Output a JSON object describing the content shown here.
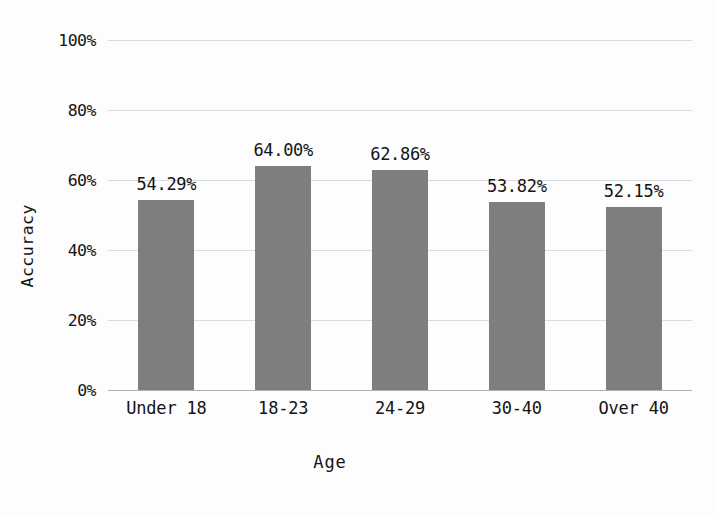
{
  "chart_data": {
    "type": "bar",
    "title": "",
    "xlabel": "Age",
    "ylabel": "Accuracy",
    "categories": [
      "Under 18",
      "18-23",
      "24-29",
      "30-40",
      "Over 40"
    ],
    "values": [
      54.29,
      64.0,
      62.86,
      53.82,
      52.15
    ],
    "value_labels": [
      "54.29%",
      "64.00%",
      "62.86%",
      "53.82%",
      "52.15%"
    ],
    "ylim": [
      0,
      100
    ],
    "yticks": [
      0,
      20,
      40,
      60,
      80,
      100
    ],
    "ytick_labels": [
      "0%",
      "20%",
      "40%",
      "60%",
      "80%",
      "100%"
    ],
    "grid": true,
    "grid_axis": "y",
    "legend": false,
    "legend_position": "none",
    "bar_color": "#7e7e7e",
    "gridline_color": "#d8dde3",
    "axis_color": "#a9b0b8",
    "background_color": "#fdfdfd",
    "text_color": "#141414"
  }
}
